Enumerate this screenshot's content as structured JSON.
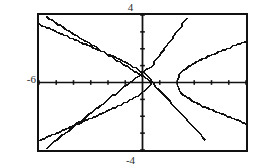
{
  "window": {
    "title": "Graphing calculator viewing window"
  },
  "axis_labels": {
    "ymax": "4",
    "ymin": "-4",
    "xmin": "-6",
    "xmax": "6"
  },
  "chart_data": {
    "type": "line",
    "title": "",
    "subtitle": "",
    "xlabel": "",
    "ylabel": "",
    "xlim": [
      -6,
      6
    ],
    "ylim": [
      -4,
      4
    ],
    "grid": false,
    "legend": "none",
    "axes": {
      "x_axis_y": 0,
      "y_axis_x": 0,
      "x_tick_step": 1,
      "y_tick_step": 1,
      "x_ticks": [
        -6,
        -5,
        -4,
        -3,
        -2,
        -1,
        0,
        1,
        2,
        3,
        4,
        5,
        6
      ],
      "y_ticks": [
        -4,
        -3,
        -2,
        -1,
        0,
        1,
        2,
        3,
        4
      ],
      "tick_style": "short-marks",
      "frame": true
    },
    "style": {
      "stroke": "#111111",
      "stroke_width": 1.6,
      "rendering": "pixelated-dithered"
    },
    "series": [
      {
        "name": "sideways-parabola-upper",
        "kind": "parametric",
        "equation": "y = sqrt(x - 2)",
        "points": [
          [
            2.0,
            0.0
          ],
          [
            2.08,
            0.3
          ],
          [
            2.2,
            0.55
          ],
          [
            2.4,
            0.75
          ],
          [
            2.7,
            0.95
          ],
          [
            3.0,
            1.15
          ],
          [
            3.4,
            1.35
          ],
          [
            3.8,
            1.55
          ],
          [
            4.3,
            1.75
          ],
          [
            4.8,
            1.95
          ],
          [
            5.3,
            2.15
          ],
          [
            5.8,
            2.35
          ],
          [
            6.0,
            2.45
          ]
        ]
      },
      {
        "name": "sideways-parabola-lower",
        "kind": "parametric",
        "equation": "y = -sqrt(x - 2)",
        "points": [
          [
            2.0,
            0.0
          ],
          [
            2.08,
            -0.3
          ],
          [
            2.2,
            -0.55
          ],
          [
            2.4,
            -0.75
          ],
          [
            2.7,
            -0.95
          ],
          [
            3.0,
            -1.15
          ],
          [
            3.4,
            -1.35
          ],
          [
            3.8,
            -1.55
          ],
          [
            4.3,
            -1.75
          ],
          [
            4.8,
            -1.95
          ],
          [
            5.3,
            -2.15
          ],
          [
            5.8,
            -2.35
          ],
          [
            6.0,
            -2.45
          ]
        ]
      },
      {
        "name": "sideways-parabola-left-upper",
        "kind": "parametric",
        "equation": "mirrored branch opening left (upper)",
        "points": [
          [
            0.6,
            0.0
          ],
          [
            0.3,
            0.35
          ],
          [
            -0.2,
            0.75
          ],
          [
            -0.8,
            1.1
          ],
          [
            -1.6,
            1.5
          ],
          [
            -2.5,
            1.9
          ],
          [
            -3.4,
            2.3
          ],
          [
            -4.3,
            2.7
          ],
          [
            -5.2,
            3.1
          ],
          [
            -6.0,
            3.45
          ]
        ]
      },
      {
        "name": "sideways-parabola-left-lower",
        "kind": "parametric",
        "equation": "mirrored branch opening left (lower)",
        "points": [
          [
            0.6,
            0.0
          ],
          [
            0.3,
            -0.35
          ],
          [
            -0.2,
            -0.75
          ],
          [
            -0.8,
            -1.1
          ],
          [
            -1.6,
            -1.5
          ],
          [
            -2.5,
            -1.9
          ],
          [
            -3.4,
            -2.3
          ],
          [
            -4.3,
            -2.7
          ],
          [
            -5.2,
            -3.1
          ],
          [
            -6.0,
            -3.45
          ]
        ]
      },
      {
        "name": "line-rising",
        "kind": "line",
        "equation": "y = x + 1",
        "points": [
          [
            -5.6,
            -3.9
          ],
          [
            0.55,
            1.0
          ],
          [
            2.6,
            3.85
          ]
        ]
      },
      {
        "name": "line-falling",
        "kind": "line",
        "equation": "y = -x + 1",
        "points": [
          [
            -5.6,
            3.9
          ],
          [
            0.6,
            0.0
          ],
          [
            3.6,
            -3.4
          ]
        ]
      }
    ]
  }
}
